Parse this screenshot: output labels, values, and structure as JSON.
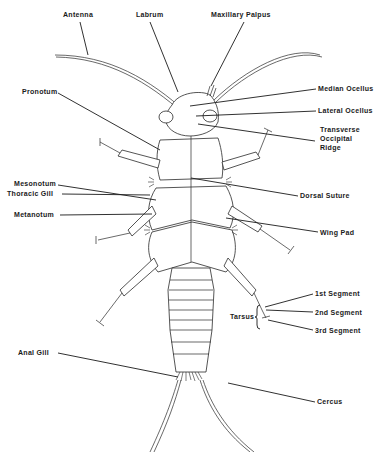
{
  "diagram": {
    "labels": {
      "antenna": "Antenna",
      "labrum": "Labrum",
      "maxillary_palpus": "Maxillary Palpus",
      "pronotum": "Pronotum",
      "median_ocellus": "Median Ocellus",
      "lateral_ocellus": "Lateral Ocellus",
      "transverse_occipital_ridge_1": "Transverse",
      "transverse_occipital_ridge_2": "Occipital",
      "transverse_occipital_ridge_3": "Ridge",
      "mesonotum": "Mesonotum",
      "dorsal_suture": "Dorsal Suture",
      "thoracic_gill": "Thoracic Gill",
      "metanotum": "Metanotum",
      "wing_pad": "Wing Pad",
      "first_segment": "1st Segment",
      "tarsus": "Tarsus",
      "second_segment": "2nd Segment",
      "third_segment": "3rd Segment",
      "anal_gill": "Anal Gill",
      "cercus": "Cercus"
    }
  }
}
